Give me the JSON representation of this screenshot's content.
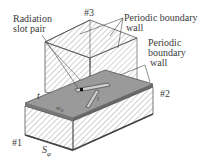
{
  "diagram": {
    "labels": {
      "radiation_slot_pair": [
        "Radiation",
        "slot pair"
      ],
      "port3": "#3",
      "periodic_wall_top": [
        "Periodic boundary",
        "wall"
      ],
      "periodic_wall_right": [
        "Periodic",
        "boundary",
        "wall"
      ],
      "port2": "#2",
      "port1": "#1",
      "thickness": "t",
      "wx": "w",
      "wx_sub": "x",
      "l": "l",
      "sphi": "S",
      "sphi_sub": "φ"
    },
    "colors": {
      "line": "#555555",
      "hatch": "#8a8a8a",
      "plate": "#9a9a9a",
      "text": "#3a3a3a"
    }
  }
}
